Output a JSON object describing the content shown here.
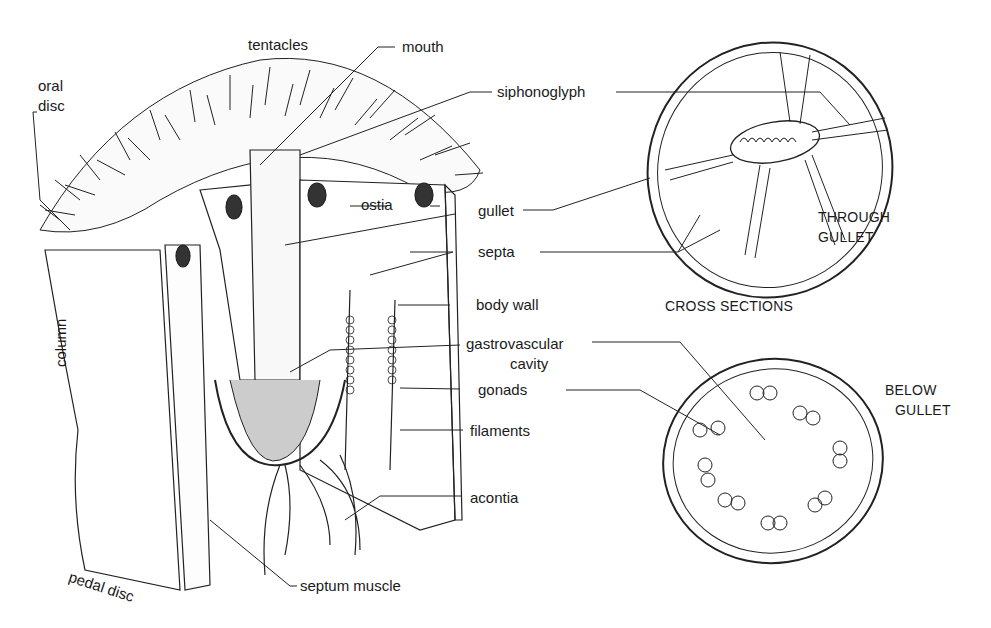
{
  "diagram": {
    "labels": {
      "tentacles": "tentacles",
      "mouth": "mouth",
      "oral_disc_line1": "oral",
      "oral_disc_line2": "disc",
      "siphonoglyph": "siphonoglyph",
      "ostia": "ostia",
      "gullet": "gullet",
      "septa": "septa",
      "body_wall": "body wall",
      "column": "column",
      "gastrovascular_line1": "gastrovascular",
      "gastrovascular_line2": "cavity",
      "gonads": "gonads",
      "filaments": "filaments",
      "acontia": "acontia",
      "pedal_disc": "pedal disc",
      "septum_muscle": "septum muscle"
    },
    "cross_sections": {
      "title": "CROSS SECTIONS",
      "through_gullet_line1": "THROUGH",
      "through_gullet_line2": "GULLET",
      "below_gullet_line1": "BELOW",
      "below_gullet_line2": "GULLET"
    }
  }
}
